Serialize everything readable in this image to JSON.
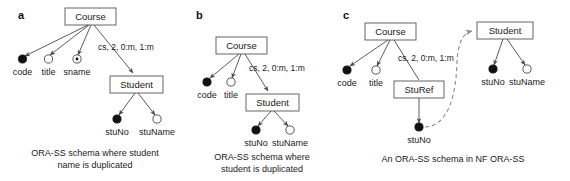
{
  "figure": {
    "background": "#ffffff",
    "line_color": "#4a4a4a",
    "box_stroke": "#555555",
    "ref_color": "#8a8a8a",
    "key_fill": "#111111"
  },
  "panels": [
    {
      "letter": "a",
      "caption_line1": "ORA-SS schema where student",
      "caption_line2": "name is duplicated",
      "nodes": [
        {
          "id": "course",
          "label": "Course"
        },
        {
          "id": "student",
          "label": "Student"
        }
      ],
      "edge_label": "cs, 2, 0:m, 1:m",
      "attributes": [
        {
          "label": "code",
          "marker": "key"
        },
        {
          "label": "title",
          "marker": "plain"
        },
        {
          "label": "sname",
          "marker": "dotted"
        },
        {
          "label": "stuNo",
          "marker": "key"
        },
        {
          "label": "stuName",
          "marker": "plain"
        }
      ]
    },
    {
      "letter": "b",
      "caption_line1": "ORA-SS schema where",
      "caption_line2": "student is duplicated",
      "nodes": [
        {
          "id": "course",
          "label": "Course"
        },
        {
          "id": "student",
          "label": "Student"
        }
      ],
      "edge_label": "cs, 2, 0:m, 1:m",
      "attributes": [
        {
          "label": "code",
          "marker": "key"
        },
        {
          "label": "title",
          "marker": "plain"
        },
        {
          "label": "stuNo",
          "marker": "key"
        },
        {
          "label": "stuName",
          "marker": "plain"
        }
      ]
    },
    {
      "letter": "c",
      "caption_line1": "An ORA-SS schema in NF ORA-SS",
      "caption_line2": "",
      "nodes": [
        {
          "id": "course",
          "label": "Course"
        },
        {
          "id": "sturef",
          "label": "StuRef"
        },
        {
          "id": "student",
          "label": "Student"
        }
      ],
      "edge_label": "cs, 2, 0:m, 1:m",
      "attributes": [
        {
          "label": "code",
          "marker": "key"
        },
        {
          "label": "title",
          "marker": "plain"
        },
        {
          "label": "stuNo",
          "marker": "key"
        },
        {
          "label": "stuNo",
          "marker": "key"
        },
        {
          "label": "stuName",
          "marker": "plain"
        }
      ]
    }
  ]
}
